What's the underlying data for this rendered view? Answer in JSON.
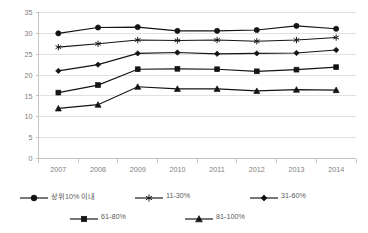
{
  "chart_data": {
    "type": "line",
    "title": "",
    "subtitle": "",
    "xlabel": "",
    "ylabel": "",
    "categories": [
      "2007",
      "2008",
      "2009",
      "2010",
      "2011",
      "2012",
      "2013",
      "2014"
    ],
    "ylim": [
      0,
      35
    ],
    "yticks": [
      0,
      5,
      10,
      15,
      20,
      25,
      30,
      35
    ],
    "ytick_labels": [
      "0",
      "5",
      "10",
      "15",
      "20",
      "25",
      "30",
      "35"
    ],
    "grid": true,
    "legend_position": "bottom",
    "series": [
      {
        "name": "상위10% 이내",
        "marker": "circle",
        "color": "#141414",
        "values": [
          30.0,
          31.4,
          31.5,
          30.6,
          30.6,
          30.8,
          31.8,
          31.1
        ]
      },
      {
        "name": "11-30%",
        "marker": "asterisk",
        "color": "#141414",
        "values": [
          26.7,
          27.5,
          28.4,
          28.3,
          28.4,
          28.1,
          28.4,
          29.0
        ]
      },
      {
        "name": "31-60%",
        "marker": "diamond",
        "color": "#141414",
        "values": [
          21.0,
          22.5,
          25.2,
          25.4,
          25.1,
          25.2,
          25.3,
          26.0
        ]
      },
      {
        "name": "61-80%",
        "marker": "square",
        "color": "#141414",
        "values": [
          15.8,
          17.6,
          21.4,
          21.5,
          21.4,
          20.9,
          21.3,
          21.9
        ]
      },
      {
        "name": "81-100%",
        "marker": "triangle",
        "color": "#141414",
        "values": [
          12.0,
          12.9,
          17.2,
          16.7,
          16.7,
          16.2,
          16.5,
          16.4
        ]
      }
    ]
  },
  "legend": {
    "rows": [
      [
        {
          "label": "상위10% 이내",
          "marker": "circle"
        },
        {
          "label": "11-30%",
          "marker": "asterisk"
        },
        {
          "label": "31-60%",
          "marker": "diamond"
        }
      ],
      [
        {
          "label": "61-80%",
          "marker": "square"
        },
        {
          "label": "81-100%",
          "marker": "triangle"
        }
      ]
    ]
  }
}
